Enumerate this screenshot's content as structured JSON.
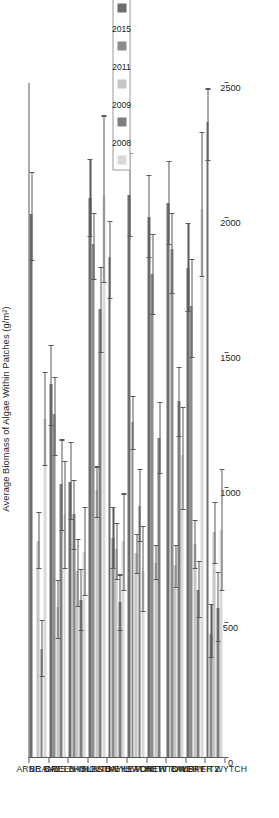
{
  "chart_data": {
    "type": "bar",
    "orientation": "horizontal",
    "title": "",
    "xlabel": "",
    "ylabel": "Average Biomass of Algae Within Patches (g/m²)",
    "value_axis_label": "Average Biomass of Algae Within Patches (g/m²)",
    "ylim": [
      0,
      2500
    ],
    "ticks": [
      0,
      500,
      1000,
      1500,
      2000,
      2500
    ],
    "tick_labels": [
      "0",
      "500",
      "1000",
      "1500",
      "2000",
      "2500"
    ],
    "grid": false,
    "legend_position": "bottom-right",
    "categories": [
      "ARNE BAY",
      "BRANDS BAY",
      "GREEN ISLAND",
      "HOLES BAY",
      "HOLTON HEATH",
      "KEYSWORTH",
      "LYTCHETT BAY",
      "NEWTON BAY",
      "OWER FITZ",
      "UPPER WYTCH"
    ],
    "series": [
      {
        "name": "2008",
        "color": "#d9d9d9",
        "values": [
          1250,
          900,
          760,
          2080,
          800,
          690,
          null,
          1120,
          2030,
          840
        ],
        "err_low": [
          1080,
          700,
          600,
          1760,
          620,
          540,
          null,
          920,
          1780,
          620
        ],
        "err_high": [
          1430,
          1100,
          930,
          2380,
          980,
          860,
          null,
          1300,
          2320,
          1070
        ]
      },
      {
        "name": "2009",
        "color": "#7f7f7f",
        "values": [
          400,
          1010,
          580,
          1660,
          575,
          930,
          1180,
          1320,
          620,
          550
        ],
        "err_low": [
          300,
          840,
          470,
          1500,
          470,
          800,
          1050,
          1190,
          520,
          430
        ],
        "err_high": [
          510,
          1180,
          700,
          1820,
          680,
          1070,
          1320,
          1450,
          730,
          690
        ]
      },
      {
        "name": "2011",
        "color": "#c6c6c6",
        "values": [
          800,
          555,
          690,
          990,
          770,
          755,
          720,
          710,
          790,
          835
        ],
        "err_low": [
          700,
          440,
          560,
          890,
          660,
          680,
          660,
          630,
          700,
          720
        ],
        "err_high": [
          910,
          660,
          810,
          1080,
          870,
          830,
          790,
          790,
          880,
          950
        ]
      },
      {
        "name": "2015",
        "color": "#8c8c8c",
        "values": [
          null,
          1270,
          900,
          1900,
          810,
          1240,
          1790,
          1880,
          1670,
          455
        ],
        "err_low": [
          null,
          1120,
          770,
          1770,
          700,
          1140,
          1640,
          1720,
          1480,
          370
        ],
        "err_high": [
          null,
          1410,
          1030,
          2020,
          930,
          1340,
          1940,
          2020,
          1850,
          570
        ]
      },
      {
        "name": "2019",
        "color": "#6e6e6e",
        "values": [
          2010,
          1380,
          1020,
          2070,
          1850,
          2080,
          2000,
          2050,
          1810,
          2350
        ],
        "err_low": [
          1840,
          1230,
          880,
          1930,
          1700,
          1930,
          1850,
          1900,
          1650,
          2210
        ],
        "err_high": [
          2170,
          1530,
          1170,
          2220,
          1990,
          2240,
          2160,
          2210,
          1980,
          2480
        ]
      }
    ]
  },
  "legend": {
    "entries": [
      {
        "label": "2008",
        "color": "#d9d9d9"
      },
      {
        "label": "2009",
        "color": "#7f7f7f"
      },
      {
        "label": "2011",
        "color": "#c6c6c6"
      },
      {
        "label": "2015",
        "color": "#8c8c8c"
      },
      {
        "label": "2019",
        "color": "#6e6e6e"
      }
    ]
  },
  "colors": {
    "axis": "#58595b",
    "text": "#231f20",
    "background": "#ffffff"
  }
}
